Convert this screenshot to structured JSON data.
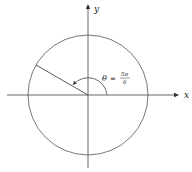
{
  "diagram": {
    "type": "unit-circle-angle",
    "axes": {
      "x_label": "x",
      "y_label": "y"
    },
    "angle": {
      "symbol": "θ",
      "equals": "=",
      "numerator": "5π",
      "denominator": "6",
      "degrees": 150
    },
    "colors": {
      "stroke": "#444444",
      "text": "#222222"
    }
  }
}
